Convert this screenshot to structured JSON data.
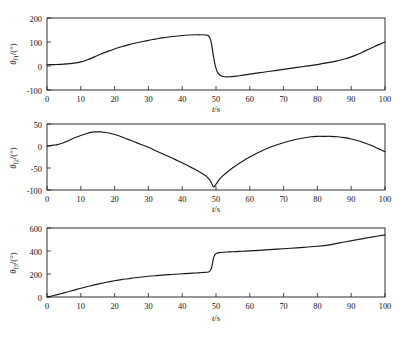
{
  "figure": {
    "background": "#ffffff",
    "line_color": "#161616",
    "axis_color": "#1a1a1a",
    "panel_count": 3
  },
  "chart_data": [
    {
      "type": "line",
      "title": "",
      "xlabel": "t/s",
      "ylabel": "θf1/(°)",
      "ylabel_symbol": "θ",
      "ylabel_subscript": "f1",
      "ylabel_unit": "/(°)",
      "xlim": [
        0,
        100
      ],
      "ylim": [
        -100,
        200
      ],
      "xticks": [
        0,
        10,
        20,
        30,
        40,
        50,
        60,
        70,
        80,
        90,
        100
      ],
      "xticklabels": [
        "0",
        "10",
        "20",
        "30",
        "40",
        "50",
        "60",
        "70",
        "80",
        "90",
        "100"
      ],
      "yticks": [
        -100,
        0,
        100,
        200
      ],
      "yticklabels": [
        "-100",
        "0",
        "100",
        "200"
      ],
      "grid": false,
      "legend": false,
      "x": [
        0,
        2,
        4,
        6,
        8,
        9,
        10,
        11,
        12,
        14,
        16,
        18,
        20,
        22,
        24,
        26,
        28,
        30,
        32,
        34,
        36,
        38,
        40,
        42,
        44,
        45,
        46,
        47,
        47.6,
        48.1,
        48.5,
        48.8,
        49.1,
        49.5,
        50,
        50.6,
        51.5,
        52.5,
        54,
        56,
        58,
        60,
        64,
        68,
        72,
        76,
        80,
        84,
        86,
        88,
        90,
        92,
        94,
        96,
        98,
        100
      ],
      "y": [
        5,
        6,
        7,
        9,
        12,
        14,
        17,
        21,
        26,
        38,
        50,
        61,
        71,
        80,
        88,
        95,
        101,
        107,
        112,
        117,
        121,
        124,
        127,
        129,
        130,
        130,
        130,
        129,
        127,
        120,
        104,
        82,
        54,
        20,
        -10,
        -30,
        -41,
        -45,
        -45,
        -42,
        -38,
        -34,
        -26,
        -18,
        -10,
        -2,
        6,
        16,
        22,
        29,
        38,
        49,
        62,
        75,
        88,
        100
      ]
    },
    {
      "type": "line",
      "title": "",
      "xlabel": "t/s",
      "ylabel": "θf2/(°)",
      "ylabel_symbol": "θ",
      "ylabel_subscript": "f2",
      "ylabel_unit": "/(°)",
      "xlim": [
        0,
        100
      ],
      "ylim": [
        -100,
        50
      ],
      "xticks": [
        0,
        10,
        20,
        30,
        40,
        50,
        60,
        70,
        80,
        90,
        100
      ],
      "xticklabels": [
        "0",
        "10",
        "20",
        "30",
        "40",
        "50",
        "60",
        "70",
        "80",
        "90",
        "100"
      ],
      "yticks": [
        -100,
        -50,
        0,
        50
      ],
      "yticklabels": [
        "-100",
        "-50",
        "0",
        "50"
      ],
      "grid": false,
      "legend": false,
      "x": [
        0,
        1,
        2,
        3,
        4,
        5,
        6,
        8,
        10,
        12,
        13,
        14,
        15,
        16,
        17,
        18,
        20,
        22,
        24,
        26,
        28,
        30,
        32,
        34,
        36,
        38,
        40,
        42,
        44,
        46,
        47,
        48,
        48.6,
        49,
        49.4,
        50,
        51,
        52,
        54,
        56,
        58,
        60,
        63,
        66,
        69,
        72,
        75,
        78,
        80,
        82,
        84,
        86,
        88,
        90,
        92,
        94,
        96,
        98,
        100
      ],
      "y": [
        0,
        1,
        2,
        3,
        5,
        8,
        11,
        18,
        24,
        29,
        31,
        32,
        32,
        32,
        31,
        30,
        26,
        21,
        15,
        9,
        3,
        -3,
        -10,
        -17,
        -24,
        -31,
        -38,
        -46,
        -54,
        -63,
        -68,
        -76,
        -83,
        -90,
        -93,
        -87,
        -76,
        -68,
        -55,
        -44,
        -34,
        -25,
        -13,
        -3,
        5,
        12,
        17,
        21,
        22,
        22,
        22,
        21,
        19,
        16,
        12,
        7,
        1,
        -6,
        -13
      ]
    },
    {
      "type": "line",
      "title": "",
      "xlabel": "t/s",
      "ylabel": "θf3/(°)",
      "ylabel_symbol": "θ",
      "ylabel_subscript": "f3",
      "ylabel_unit": "/(°)",
      "xlim": [
        0,
        100
      ],
      "ylim": [
        0,
        600
      ],
      "xticks": [
        0,
        10,
        20,
        30,
        40,
        50,
        60,
        70,
        80,
        90,
        100
      ],
      "xticklabels": [
        "0",
        "10",
        "20",
        "30",
        "40",
        "50",
        "60",
        "70",
        "80",
        "90",
        "100"
      ],
      "yticks": [
        0,
        200,
        400,
        600
      ],
      "yticklabels": [
        "0",
        "200",
        "400",
        "600"
      ],
      "grid": false,
      "legend": false,
      "x": [
        0,
        1,
        2,
        4,
        6,
        8,
        10,
        12,
        14,
        16,
        18,
        20,
        22,
        24,
        26,
        28,
        30,
        32,
        34,
        36,
        38,
        40,
        42,
        44,
        46,
        47,
        47.8,
        48.3,
        48.7,
        49,
        49.3,
        49.7,
        50.2,
        51,
        52,
        54,
        56,
        58,
        60,
        64,
        68,
        72,
        76,
        80,
        84,
        88,
        92,
        96,
        100
      ],
      "y": [
        0,
        6,
        13,
        28,
        44,
        60,
        76,
        91,
        105,
        118,
        130,
        141,
        151,
        159,
        167,
        174,
        180,
        185,
        190,
        194,
        198,
        202,
        206,
        209,
        213,
        215,
        218,
        228,
        255,
        300,
        340,
        368,
        380,
        386,
        389,
        392,
        395,
        398,
        401,
        408,
        416,
        424,
        432,
        441,
        456,
        478,
        500,
        521,
        540
      ]
    }
  ],
  "axis_titles": {
    "x_italic": "t",
    "x_sep": "/",
    "x_unit": "s"
  }
}
